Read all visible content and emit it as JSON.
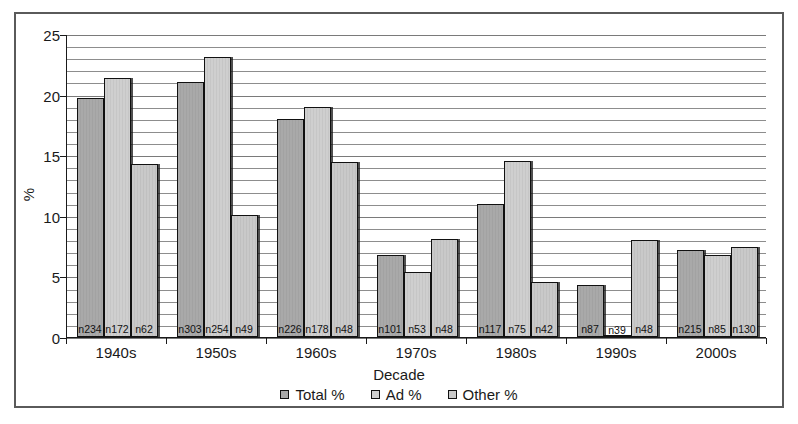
{
  "chart_data": {
    "type": "bar",
    "title": "",
    "xlabel": "Decade",
    "ylabel": "%",
    "ylim": [
      0,
      25
    ],
    "yticks": [
      0,
      5,
      10,
      15,
      20,
      25
    ],
    "grid": true,
    "minor_grid_step": 1,
    "legend_position": "bottom",
    "categories": [
      "1940s",
      "1950s",
      "1960s",
      "1970s",
      "1980s",
      "1990s",
      "2000s"
    ],
    "series": [
      {
        "name": "Total %",
        "color": "#a9a9a9",
        "values": [
          19.7,
          21.0,
          18.0,
          6.8,
          11.0,
          4.3,
          7.2
        ],
        "point_labels": [
          "n234",
          "n303",
          "n226",
          "n101",
          "n117",
          "n87",
          "n215"
        ]
      },
      {
        "name": "Ad %",
        "color": "#cfcfcf",
        "values": [
          21.4,
          23.1,
          19.0,
          5.4,
          14.5,
          0.0,
          6.8
        ],
        "point_labels": [
          "n172",
          "n254",
          "n178",
          "n53",
          "n75",
          "n39",
          "n85"
        ]
      },
      {
        "name": "Other %",
        "color": "#c9c9c9",
        "values": [
          14.3,
          10.1,
          14.4,
          8.1,
          4.5,
          8.0,
          7.4
        ],
        "point_labels": [
          "n62",
          "n49",
          "n48",
          "n48",
          "n42",
          "n48",
          "n130"
        ]
      }
    ]
  }
}
